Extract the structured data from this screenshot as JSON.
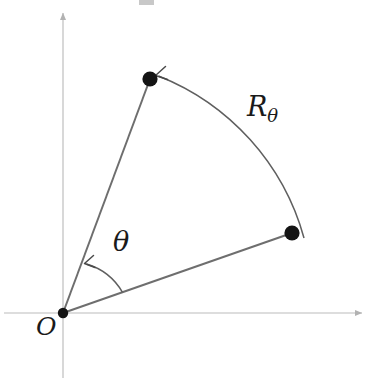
{
  "figure": {
    "domain": "diagram",
    "kind": "geometry-diagram",
    "canvas": {
      "width": 376,
      "height": 382,
      "background": "#ffffff"
    },
    "colors": {
      "axis": "#b9b9b9",
      "ray": "#6e6e6e",
      "arc": "#5a5a5a",
      "point_fill": "#141414",
      "label_text": "#1a1a1a",
      "background": "#ffffff"
    },
    "labels": {
      "origin": "O",
      "angle": "θ",
      "rotation_base": "R",
      "rotation_subscript": "θ"
    },
    "axes": {
      "origin": {
        "x": 63,
        "y": 313
      },
      "x_axis": {
        "x_start": 4,
        "x_end": 368,
        "y": 313,
        "arrow": "right"
      },
      "y_axis": {
        "x": 63,
        "y_start": 378,
        "y_end": 6,
        "arrow": "up"
      }
    },
    "points": [
      {
        "name": "image-point",
        "x": 150,
        "y": 79,
        "radius": 7.5
      },
      {
        "name": "source-point",
        "x": 292,
        "y": 233,
        "radius": 7.5
      }
    ],
    "rays": [
      {
        "name": "ray-to-image-point",
        "x1": 63,
        "y1": 313,
        "x2": 150,
        "y2": 79
      },
      {
        "name": "ray-to-source-point",
        "x1": 63,
        "y1": 313,
        "x2": 292,
        "y2": 233
      }
    ],
    "rotation_arc": {
      "name": "rotation-arc",
      "center": {
        "x": 63,
        "y": 313
      },
      "radius": 244,
      "start": {
        "x": 304,
        "y": 237
      },
      "end": {
        "x": 157,
        "y": 75
      },
      "arrow": "at-end",
      "sweep": "counterclockwise"
    },
    "angle_arc": {
      "name": "angle-arc",
      "center": {
        "x": 63,
        "y": 313
      },
      "radius": 62,
      "start": {
        "x": 122,
        "y": 292
      },
      "end": {
        "x": 86,
        "y": 263
      },
      "arrow": "at-end",
      "sweep": "counterclockwise"
    },
    "artifact": {
      "name": "top-crop-artifact",
      "x": 139,
      "y": 0,
      "width": 15,
      "height": 5
    }
  }
}
